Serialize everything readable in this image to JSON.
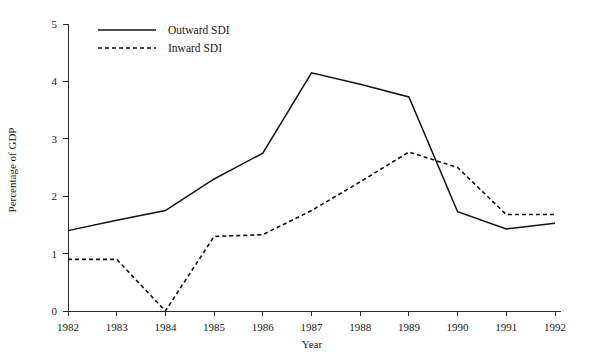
{
  "chart_data": {
    "type": "line",
    "title": "",
    "xlabel": "Year",
    "ylabel": "Percentage of GDP",
    "categories": [
      "1982",
      "1983",
      "1984",
      "1985",
      "1986",
      "1987",
      "1988",
      "1989",
      "1990",
      "1991",
      "1992"
    ],
    "x": [
      1982,
      1983,
      1984,
      1985,
      1986,
      1987,
      1988,
      1989,
      1990,
      1991,
      1992
    ],
    "xlim": [
      1982,
      1992
    ],
    "ylim": [
      0,
      5
    ],
    "yticks": [
      "0",
      "1",
      "2",
      "3",
      "4",
      "5"
    ],
    "ytick_values": [
      0,
      1,
      2,
      3,
      4,
      5
    ],
    "grid": false,
    "legend_position": "top-left",
    "series": [
      {
        "name": "Outward SDI",
        "style": "solid",
        "color": "#111111",
        "values": [
          1.4,
          1.58,
          1.75,
          2.3,
          2.75,
          4.15,
          3.95,
          3.73,
          1.73,
          1.43,
          1.53
        ]
      },
      {
        "name": "Inward SDI",
        "style": "dotted",
        "color": "#111111",
        "values": [
          0.9,
          0.9,
          0.0,
          1.3,
          1.33,
          1.75,
          2.25,
          2.77,
          2.5,
          1.68,
          1.68
        ]
      }
    ]
  },
  "legend": {
    "items": [
      {
        "label": "Outward  SDI",
        "style": "solid"
      },
      {
        "label": "Inward SDI",
        "style": "dotted"
      }
    ]
  }
}
